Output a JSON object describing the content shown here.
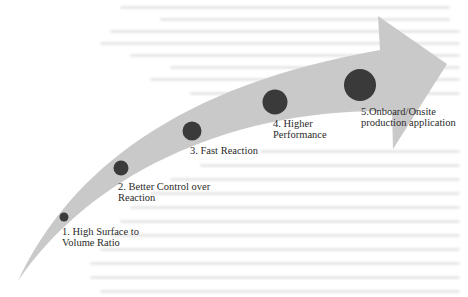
{
  "diagram": {
    "type": "curved-progress-arrow",
    "colors": {
      "arrow_fill": "#c9c9c9",
      "circle_fill": "#3a3a3a",
      "label_text": "#2a2a2a",
      "background": "#ffffff"
    },
    "steps": [
      {
        "number": 1,
        "line1": "1. High Surface to",
        "line2": "Volume Ratio"
      },
      {
        "number": 2,
        "line1": "2. Better Control over",
        "line2": "Reaction"
      },
      {
        "number": 3,
        "line1": "3. Fast Reaction",
        "line2": ""
      },
      {
        "number": 4,
        "line1": "4. Higher",
        "line2": "Performance"
      },
      {
        "number": 5,
        "line1": "5.Onboard/Onsite",
        "line2": "production application"
      }
    ]
  }
}
